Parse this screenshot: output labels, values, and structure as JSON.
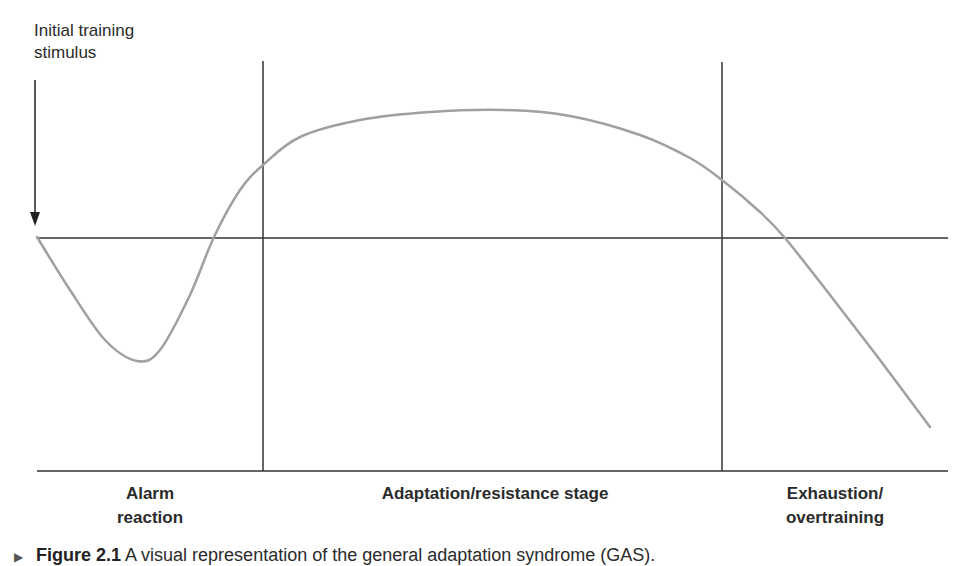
{
  "diagram": {
    "title": "General adaptation syndrome",
    "annotation": {
      "line1": "Initial training",
      "line2": "stimulus"
    },
    "stages": [
      {
        "line1": "Alarm",
        "line2": "reaction"
      },
      {
        "line1": "Adaptation/resistance stage",
        "line2": ""
      },
      {
        "line1": "Exhaustion/",
        "line2": "overtraining"
      }
    ],
    "colors": {
      "axis": "#333333",
      "curve": "#a0a0a0",
      "text": "#2b2b2b"
    },
    "curve_points": [
      [
        37,
        237
      ],
      [
        70,
        290
      ],
      [
        105,
        340
      ],
      [
        137,
        361
      ],
      [
        160,
        350
      ],
      [
        190,
        295
      ],
      [
        214,
        237
      ],
      [
        240,
        190
      ],
      [
        263,
        165
      ],
      [
        300,
        137
      ],
      [
        360,
        120
      ],
      [
        430,
        112
      ],
      [
        505,
        110
      ],
      [
        570,
        116
      ],
      [
        640,
        135
      ],
      [
        690,
        158
      ],
      [
        722,
        180
      ],
      [
        760,
        212
      ],
      [
        785,
        238
      ],
      [
        830,
        295
      ],
      [
        880,
        360
      ],
      [
        930,
        427
      ]
    ]
  },
  "caption": {
    "marker": "▶",
    "figure_label": "Figure 2.1",
    "text": "A visual representation of the general adaptation syndrome (GAS)."
  }
}
